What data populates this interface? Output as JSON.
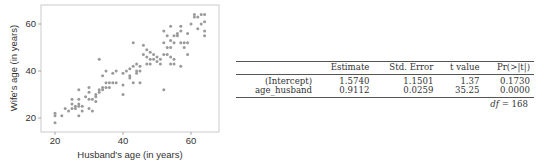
{
  "chart_data": [
    {
      "type": "scatter",
      "title": "",
      "xlabel": "Husband's age (in years)",
      "ylabel": "Wife's age (in years)",
      "xlim": [
        17,
        66
      ],
      "ylim": [
        15,
        68
      ],
      "xticks": [
        20,
        40,
        60
      ],
      "yticks": [
        20,
        40,
        60
      ],
      "grid": false,
      "legend": null,
      "marker_color": "#999999",
      "points": [
        [
          20,
          22
        ],
        [
          20,
          21
        ],
        [
          20,
          18
        ],
        [
          22,
          21
        ],
        [
          23,
          24
        ],
        [
          24,
          23
        ],
        [
          25,
          28
        ],
        [
          25,
          26
        ],
        [
          25,
          24
        ],
        [
          26,
          25
        ],
        [
          26,
          24
        ],
        [
          27,
          32
        ],
        [
          27,
          28
        ],
        [
          27,
          26
        ],
        [
          27,
          25
        ],
        [
          27,
          21
        ],
        [
          28,
          25
        ],
        [
          28,
          23
        ],
        [
          29,
          29
        ],
        [
          30,
          33
        ],
        [
          30,
          31
        ],
        [
          30,
          28
        ],
        [
          30,
          24
        ],
        [
          31,
          28
        ],
        [
          31,
          23
        ],
        [
          32,
          30
        ],
        [
          32,
          29
        ],
        [
          32,
          27
        ],
        [
          33,
          45
        ],
        [
          33,
          32
        ],
        [
          33,
          31
        ],
        [
          34,
          33
        ],
        [
          34,
          32
        ],
        [
          34,
          38
        ],
        [
          35,
          40
        ],
        [
          35,
          35
        ],
        [
          35,
          33
        ],
        [
          36,
          35
        ],
        [
          36,
          33
        ],
        [
          37,
          39
        ],
        [
          37,
          35
        ],
        [
          38,
          40
        ],
        [
          38,
          35
        ],
        [
          40,
          39
        ],
        [
          40,
          34
        ],
        [
          40,
          30
        ],
        [
          41,
          40
        ],
        [
          42,
          38
        ],
        [
          42,
          37
        ],
        [
          42,
          41
        ],
        [
          43,
          52
        ],
        [
          43,
          35
        ],
        [
          43,
          42
        ],
        [
          44,
          40
        ],
        [
          44,
          39
        ],
        [
          44,
          43
        ],
        [
          45,
          42
        ],
        [
          45,
          40
        ],
        [
          45,
          35
        ],
        [
          46,
          51
        ],
        [
          46,
          47
        ],
        [
          47,
          49
        ],
        [
          47,
          46
        ],
        [
          47,
          43
        ],
        [
          48,
          48
        ],
        [
          48,
          45
        ],
        [
          48,
          43
        ],
        [
          49,
          47
        ],
        [
          49,
          45
        ],
        [
          50,
          46
        ],
        [
          50,
          44
        ],
        [
          51,
          45
        ],
        [
          51,
          43
        ],
        [
          52,
          57
        ],
        [
          52,
          52
        ],
        [
          52,
          47
        ],
        [
          52,
          32
        ],
        [
          53,
          55
        ],
        [
          53,
          50
        ],
        [
          53,
          47
        ],
        [
          54,
          59
        ],
        [
          54,
          53
        ],
        [
          54,
          50
        ],
        [
          54,
          46
        ],
        [
          54,
          43
        ],
        [
          55,
          55
        ],
        [
          55,
          52
        ],
        [
          55,
          45
        ],
        [
          55,
          43
        ],
        [
          56,
          56
        ],
        [
          56,
          55
        ],
        [
          57,
          59
        ],
        [
          57,
          57
        ],
        [
          57,
          52
        ],
        [
          57,
          42
        ],
        [
          58,
          52
        ],
        [
          58,
          50
        ],
        [
          59,
          56
        ],
        [
          59,
          52
        ],
        [
          59,
          47
        ],
        [
          60,
          60
        ],
        [
          61,
          64
        ],
        [
          61,
          63
        ],
        [
          62,
          63
        ],
        [
          62,
          58
        ],
        [
          63,
          64
        ],
        [
          63,
          60
        ],
        [
          64,
          64
        ],
        [
          64,
          61
        ],
        [
          64,
          57
        ],
        [
          64,
          55
        ]
      ]
    },
    {
      "type": "table",
      "columns": [
        "",
        "Estimate",
        "Std. Error",
        "t value",
        "Pr(>|t|)"
      ],
      "rows": [
        [
          "(Intercept)",
          "1.5740",
          "1.1501",
          "1.37",
          "0.1730"
        ],
        [
          "age_husband",
          "0.9112",
          "0.0259",
          "35.25",
          "0.0000"
        ]
      ],
      "footer": "df = 168"
    }
  ],
  "plot": {
    "xlabel": "Husband's age (in years)",
    "ylabel": "Wife's age (in years)",
    "xticks": [
      "20",
      "40",
      "60"
    ],
    "yticks": [
      "20",
      "40",
      "60"
    ]
  },
  "table": {
    "header": [
      "",
      "Estimate",
      "Std. Error",
      "t value",
      "Pr(>|t|)"
    ],
    "rows": [
      {
        "name": "(Intercept)",
        "estimate": "1.5740",
        "se": "1.1501",
        "t": "1.37",
        "p": "0.1730"
      },
      {
        "name": "age_husband",
        "estimate": "0.9112",
        "se": "0.0259",
        "t": "35.25",
        "p": "0.0000"
      }
    ],
    "df_label": "df",
    "df_eq": " = 168"
  }
}
